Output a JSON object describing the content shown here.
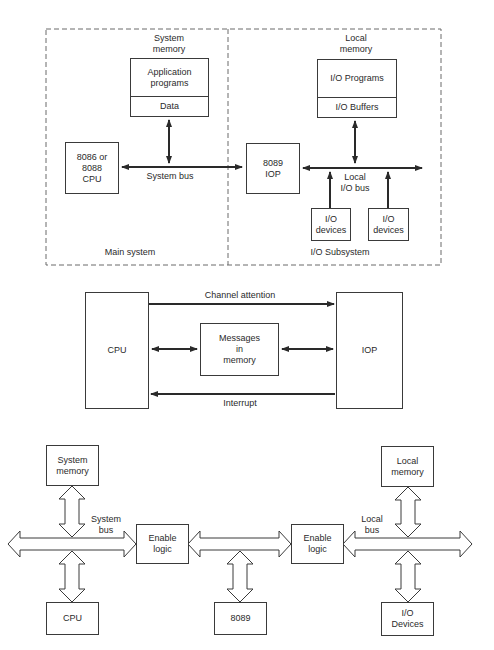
{
  "figure_top": {
    "main_system": {
      "label": "Main system",
      "system_memory_label": "System\nmemory",
      "app_programs": "Application\nprograms",
      "data": "Data",
      "cpu": "8086 or\n8088\nCPU",
      "system_bus": "System bus"
    },
    "io_subsystem": {
      "label": "I/O Subsystem",
      "local_memory_label": "Local\nmemory",
      "io_programs": "I/O Programs",
      "io_buffers": "I/O Buffers",
      "iop": "8089\nIOP",
      "local_io_bus": "Local\nI/O bus",
      "io_devices_1": "I/O\ndevices",
      "io_devices_2": "I/O\ndevices"
    }
  },
  "figure_middle": {
    "cpu": "CPU",
    "iop": "IOP",
    "messages": "Messages\nin\nmemory",
    "channel_attention": "Channel attention",
    "interrupt": "Interrupt"
  },
  "figure_bottom": {
    "system_memory": "System\nmemory",
    "cpu": "CPU",
    "system_bus": "System\nbus",
    "enable_logic_1": "Enable\nlogic",
    "chip_8089": "8089",
    "enable_logic_2": "Enable\nlogic",
    "local_bus": "Local\nbus",
    "local_memory": "Local\nmemory",
    "io_devices": "I/O\nDevices"
  },
  "colors": {
    "line": "#2a2a2a",
    "dash": "#6a6a6a",
    "background": "#ffffff"
  }
}
